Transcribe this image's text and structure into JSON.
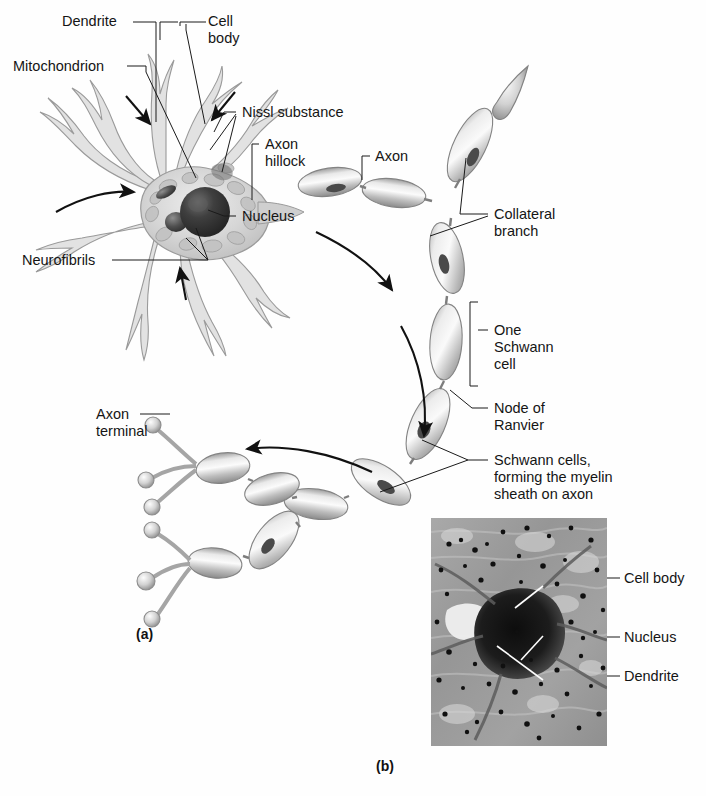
{
  "figure": {
    "background_color": "#fefefe",
    "ink_color": "#151515"
  },
  "panels": [
    {
      "key": "a",
      "label": "(a)",
      "caption": "Diagrammatic view of a multipolar neuron"
    },
    {
      "key": "b",
      "label": "(b)",
      "caption": "Photomicrograph of a neuron cell body"
    }
  ],
  "panel_a": {
    "labels": [
      {
        "id": "dendrite",
        "text": "Dendrite"
      },
      {
        "id": "cell-body",
        "text": "Cell\nbody"
      },
      {
        "id": "mitochondrion",
        "text": "Mitochondrion"
      },
      {
        "id": "nissl-substance",
        "text": "Nissl substance"
      },
      {
        "id": "axon-hillock",
        "text": "Axon\nhillock"
      },
      {
        "id": "axon",
        "text": "Axon"
      },
      {
        "id": "nucleus",
        "text": "Nucleus"
      },
      {
        "id": "neurofibrils",
        "text": "Neurofibrils"
      },
      {
        "id": "collateral-branch",
        "text": "Collateral\nbranch"
      },
      {
        "id": "one-schwann-cell",
        "text": "One\nSchwann\ncell"
      },
      {
        "id": "node-of-ranvier",
        "text": "Node of\nRanvier"
      },
      {
        "id": "schwann-cells-myelin",
        "text": "Schwann cells,\nforming the myelin\nsheath on axon"
      },
      {
        "id": "axon-terminal",
        "text": "Axon\nterminal"
      }
    ],
    "structures": {
      "soma_count": 1,
      "dendrite_count": 7,
      "myelin_segment_count": 12,
      "node_count": 11,
      "axon_terminal_bulb_count": 6,
      "terminal_branch_count": 2,
      "direction_arrow_count": 3,
      "pointer_arrow_count": 3
    }
  },
  "panel_b": {
    "image_type": "light-micrograph",
    "description": "stained nervous tissue showing a neuron cell body",
    "labels": [
      {
        "id": "cell-body",
        "text": "Cell body"
      },
      {
        "id": "nucleus",
        "text": "Nucleus"
      },
      {
        "id": "dendrite",
        "text": "Dendrite"
      }
    ]
  },
  "colors": {
    "line": "#151515",
    "myelin_light": "#f2f2f2",
    "myelin_mid": "#b9b9b9",
    "myelin_dark": "#8d8d8d",
    "soma_cyto": "#d9d9d9",
    "nucleus": "#3a3a3a",
    "micrograph_bg": "#9a9a9a",
    "micrograph_dark": "#1c1c1c"
  }
}
